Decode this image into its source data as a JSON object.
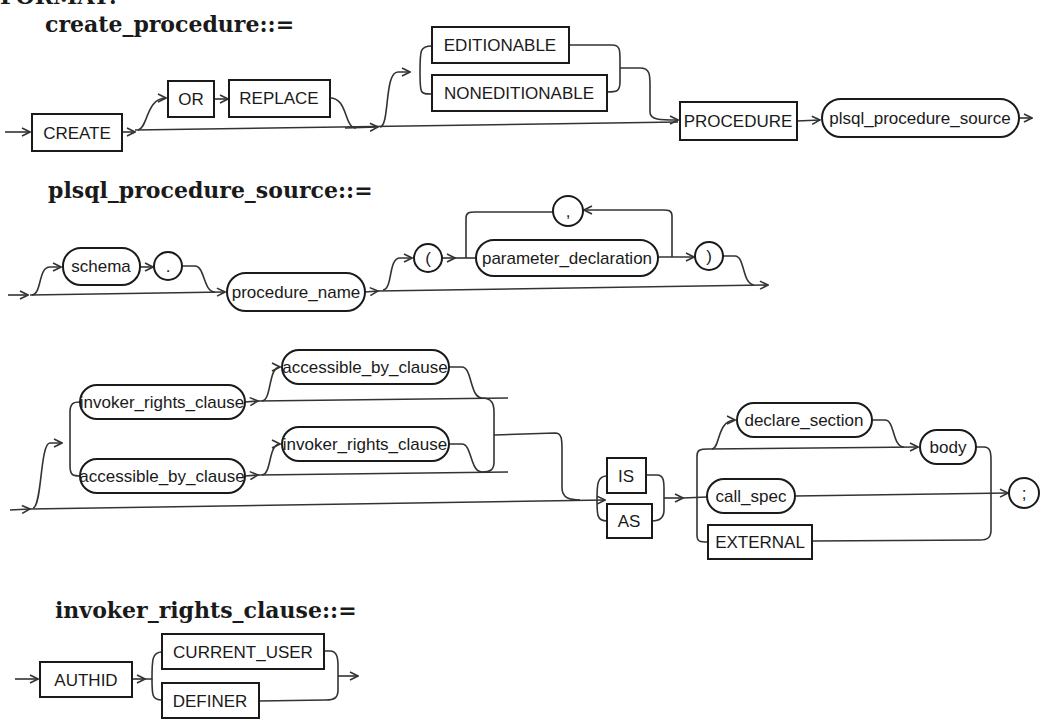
{
  "header": {
    "format_label": "FORMAT:"
  },
  "create_procedure": {
    "title": "create_procedure::=",
    "nodes": {
      "create": "CREATE",
      "or": "OR",
      "replace": "REPLACE",
      "editionable": "EDITIONABLE",
      "noneditionable": "NONEDITIONABLE",
      "procedure": "PROCEDURE",
      "plsql_procedure_source": "plsql_procedure_source"
    }
  },
  "plsql_procedure_source": {
    "title": "plsql_procedure_source::=",
    "nodes": {
      "schema": "schema",
      "dot": ".",
      "procedure_name": "procedure_name",
      "open_paren": "(",
      "parameter_declaration": "parameter_declaration",
      "comma": ",",
      "close_paren": ")",
      "invoker_rights_clause_1": "invoker_rights_clause",
      "accessible_by_clause_1": "accessible_by_clause",
      "accessible_by_clause_2": "accessible_by_clause",
      "invoker_rights_clause_2": "invoker_rights_clause",
      "is": "IS",
      "as": "AS",
      "declare_section": "declare_section",
      "body": "body",
      "call_spec": "call_spec",
      "external": "EXTERNAL",
      "semicolon": ";"
    }
  },
  "invoker_rights_clause": {
    "title": "invoker_rights_clause::=",
    "nodes": {
      "authid": "AUTHID",
      "current_user": "CURRENT_USER",
      "definer": "DEFINER"
    }
  },
  "style": {
    "ink_color": "#1a1a1a",
    "line_color": "#333333",
    "background": "#ffffff"
  }
}
